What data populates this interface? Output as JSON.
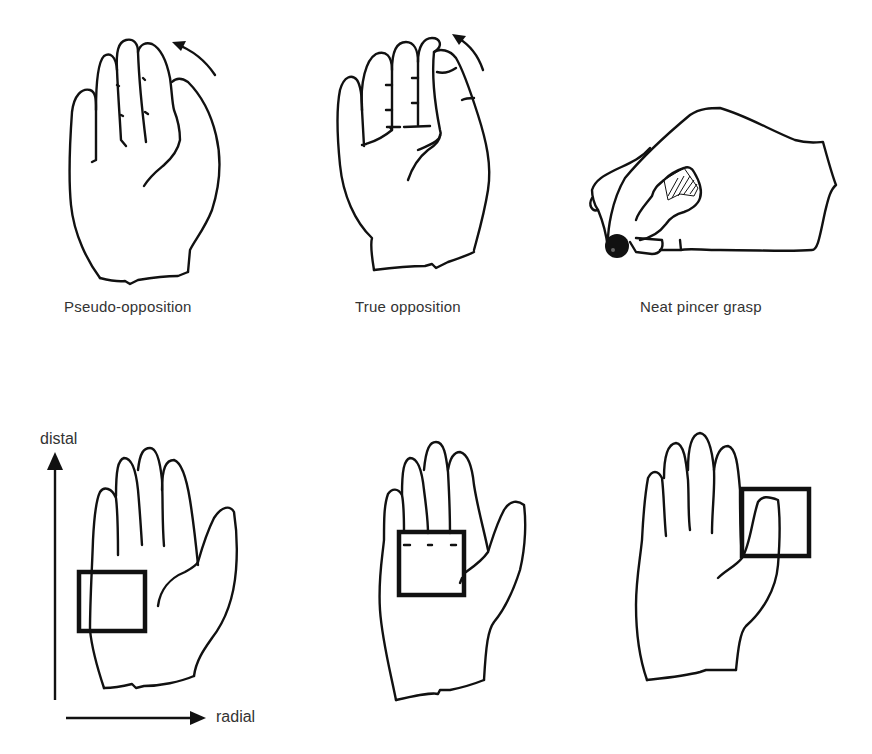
{
  "figure": {
    "top_row": {
      "panels": [
        {
          "id": "pseudo-opposition",
          "caption": "Pseudo-opposition"
        },
        {
          "id": "true-opposition",
          "caption": "True opposition"
        },
        {
          "id": "neat-pincer-grasp",
          "caption": "Neat pincer grasp"
        }
      ]
    },
    "bottom_row": {
      "axes": {
        "vertical_label": "distal",
        "horizontal_label": "radial"
      },
      "panels": [
        {
          "id": "palm-box-ulnar",
          "highlight": "box over ulnar palm region"
        },
        {
          "id": "palm-box-center",
          "highlight": "box over central palm below fingers"
        },
        {
          "id": "palm-box-thumb",
          "highlight": "box over thumb tip, radial side"
        }
      ]
    },
    "colors": {
      "ink": "#111111",
      "background": "#ffffff",
      "text": "#333333"
    }
  }
}
